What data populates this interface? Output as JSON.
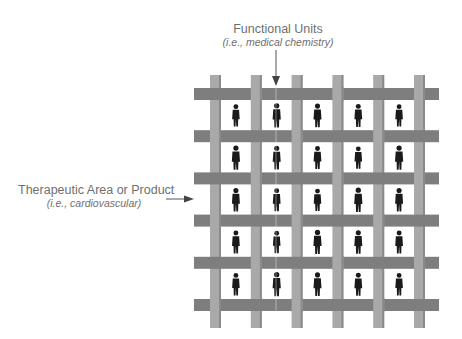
{
  "diagram": {
    "type": "matrix-organization",
    "top_label": {
      "title": "Functional Units",
      "example": "(i.e., medical chemistry)"
    },
    "left_label": {
      "title": "Therapeutic Area or Product",
      "example": "(i.e., cardiovascular)"
    },
    "grid": {
      "columns": 5,
      "rows": 5,
      "vertical_bars": 6,
      "horizontal_bars": 6,
      "cell_content": "person-silhouette"
    },
    "colors": {
      "vertical_bar": "#a9a9a9",
      "vertical_bar_edge": "#8a8a8a",
      "horizontal_bar": "#7e7e7e",
      "person": "#1a1a1a",
      "text": "#6f6f6f",
      "arrow": "#555555"
    }
  }
}
